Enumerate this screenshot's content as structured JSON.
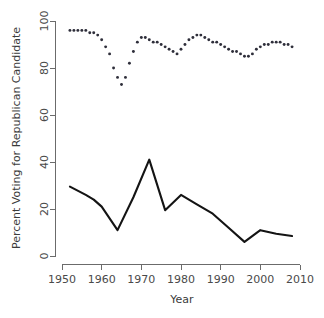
{
  "chart_data": {
    "type": "line",
    "title": "",
    "subtitle": "",
    "xlabel": "Year",
    "ylabel": "Percent Voting for Republican Candidate",
    "xlim": [
      1950,
      2010
    ],
    "ylim": [
      0,
      100
    ],
    "xticks": [
      1950,
      1960,
      1970,
      1980,
      1990,
      2000,
      2010
    ],
    "xtick_labels": [
      "1950",
      "1960",
      "1970",
      "1980",
      "1990",
      "2000",
      "2010"
    ],
    "yticks": [
      0,
      20,
      40,
      60,
      80,
      100
    ],
    "ytick_labels": [
      "0",
      "20",
      "40",
      "60",
      "80",
      "100"
    ],
    "grid": false,
    "legend": false,
    "legend_position": "none",
    "annotations": [],
    "series": [
      {
        "name": "dotted-upper-series",
        "style": "dotted",
        "marker": "point",
        "x": [
          1952,
          1953,
          1954,
          1955,
          1956,
          1957,
          1958,
          1959,
          1960,
          1961,
          1962,
          1963,
          1964,
          1965,
          1966,
          1967,
          1968,
          1969,
          1970,
          1971,
          1972,
          1973,
          1974,
          1975,
          1976,
          1977,
          1978,
          1979,
          1980,
          1981,
          1982,
          1983,
          1984,
          1985,
          1986,
          1987,
          1988,
          1989,
          1990,
          1991,
          1992,
          1993,
          1994,
          1995,
          1996,
          1997,
          1998,
          1999,
          2000,
          2001,
          2002,
          2003,
          2004,
          2005,
          2006,
          2007,
          2008
        ],
        "values": [
          96,
          96,
          96,
          96,
          96,
          95,
          95,
          94,
          92,
          89,
          86,
          80,
          76,
          73,
          76,
          82,
          87,
          91,
          93,
          93,
          92,
          91,
          91,
          90,
          89,
          88,
          87,
          86,
          88,
          90,
          92,
          93,
          94,
          94,
          93,
          92,
          91,
          91,
          90,
          89,
          88,
          87,
          87,
          86,
          85,
          85,
          86,
          88,
          89,
          90,
          90,
          91,
          91,
          91,
          90,
          90,
          89
        ]
      },
      {
        "name": "solid-lower-series",
        "style": "solid",
        "marker": "none",
        "x": [
          1952,
          1956,
          1958,
          1960,
          1964,
          1968,
          1972,
          1976,
          1980,
          1984,
          1988,
          1992,
          1996,
          2000,
          2004,
          2008
        ],
        "values": [
          29.5,
          26,
          24,
          21,
          11,
          25,
          41,
          19.5,
          26,
          22,
          18,
          12,
          6,
          11,
          9.5,
          8.5
        ]
      }
    ]
  },
  "figure": {
    "background_color": "#ffffff",
    "line_color": "#141414",
    "dot_color": "#2e2e3a",
    "axis_color": "#6b6b6b",
    "text_color": "#3b3b3b"
  }
}
